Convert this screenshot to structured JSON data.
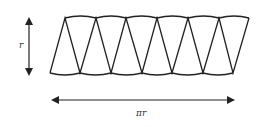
{
  "diagram": {
    "height_label": "r",
    "width_label": "πr",
    "sector_count": 12,
    "stroke_color": "#222222",
    "background": "#ffffff"
  }
}
